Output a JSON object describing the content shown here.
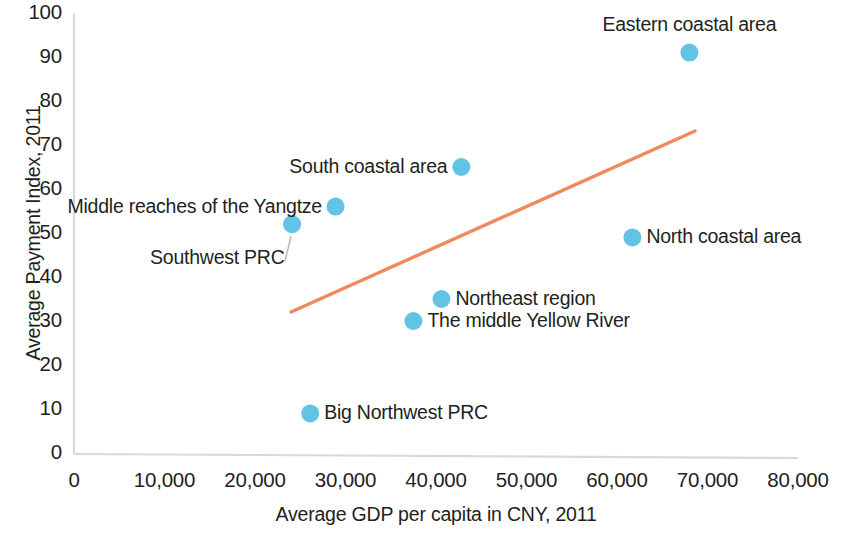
{
  "chart_data": {
    "type": "scatter",
    "title": "",
    "xlabel": "Average GDP per capita in CNY, 2011",
    "ylabel": "Average Payment Index, 2011",
    "xlim": [
      0,
      80000
    ],
    "ylim": [
      0,
      100
    ],
    "grid": false,
    "legend": "none",
    "point_color": "#62C4E5",
    "trendline_color": "#F08A5C",
    "axis_color": "#d9d9d9",
    "xticks": [
      0,
      10000,
      20000,
      30000,
      40000,
      50000,
      60000,
      70000,
      80000
    ],
    "xtick_labels": [
      "0",
      "10,000",
      "20,000",
      "30,000",
      "40,000",
      "50,000",
      "60,000",
      "70,000",
      "80,000"
    ],
    "yticks": [
      0,
      10,
      20,
      30,
      40,
      50,
      60,
      70,
      80,
      90,
      100
    ],
    "ytick_labels": [
      "0",
      "10",
      "20",
      "30",
      "40",
      "50",
      "60",
      "70",
      "80",
      "90",
      "100"
    ],
    "points": [
      {
        "label": "Eastern coastal area",
        "x": 68000,
        "y": 91,
        "label_pos": "above"
      },
      {
        "label": "South coastal area",
        "x": 42800,
        "y": 65,
        "label_pos": "left"
      },
      {
        "label": "Middle reaches of the Yangtze",
        "x": 28900,
        "y": 56,
        "label_pos": "left"
      },
      {
        "label": "Southwest PRC",
        "x": 24100,
        "y": 52,
        "label_pos": "leader-below-left"
      },
      {
        "label": "North coastal area",
        "x": 61700,
        "y": 49,
        "label_pos": "right"
      },
      {
        "label": "Northeast region",
        "x": 40600,
        "y": 35,
        "label_pos": "right"
      },
      {
        "label": "The middle Yellow River",
        "x": 37500,
        "y": 30,
        "label_pos": "right"
      },
      {
        "label": "Big Northwest PRC",
        "x": 26100,
        "y": 9,
        "label_pos": "right"
      }
    ],
    "trendline": {
      "x_start": 24000,
      "y_start": 32,
      "x_end": 68600,
      "y_end": 73
    }
  }
}
